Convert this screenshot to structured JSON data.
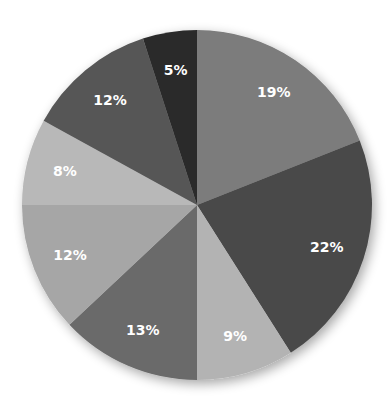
{
  "chart_data": {
    "type": "pie",
    "title": "",
    "start_angle_deg": 0,
    "direction": "clockwise",
    "categories": [
      "Slice 1",
      "Slice 2",
      "Slice 3",
      "Slice 4",
      "Slice 5",
      "Slice 6",
      "Slice 7",
      "Slice 8"
    ],
    "values": [
      19,
      22,
      9,
      13,
      12,
      8,
      12,
      5
    ],
    "labels": [
      "19%",
      "22%",
      "9%",
      "13%",
      "12%",
      "8%",
      "12%",
      "5%"
    ],
    "colors": [
      "#7b7b7b",
      "#4a4a4a",
      "#b3b3b3",
      "#6b6b6b",
      "#a6a6a6",
      "#b8b8b8",
      "#565656",
      "#2b2b2b"
    ],
    "legend": "none",
    "data_labels": "percentage inside slices"
  },
  "geometry": {
    "cx": 197,
    "cy": 205,
    "r": 175
  }
}
